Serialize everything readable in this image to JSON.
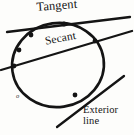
{
  "figure": {
    "background_color": "#fdfdfb",
    "ink_color": "#141414",
    "labels": {
      "tangent": "Tangent",
      "secant": "Secant",
      "exterior_line_1": "Exterior",
      "exterior_line_2": "line",
      "center_point": "o"
    }
  },
  "chart_data": {
    "type": "diagram",
    "xlabel": "",
    "ylabel": "",
    "xlim": [
      0,
      134
    ],
    "ylim": [
      0,
      135
    ],
    "grid": false,
    "legend": "none",
    "shapes": [
      {
        "name": "circle",
        "kind": "ellipse",
        "cx": 58,
        "cy": 65,
        "rx": 46,
        "ry": 42,
        "rotation_deg": -8,
        "stroke": "#141414",
        "stroke_width": 2.6,
        "fill": "none"
      },
      {
        "name": "tangent-line",
        "kind": "line",
        "x1": 7,
        "y1": 32,
        "x2": 130,
        "y2": 17,
        "stroke": "#141414",
        "stroke_width": 2.3,
        "touches_circle_at": [
          64,
          24
        ],
        "intersections": 1
      },
      {
        "name": "secant-line",
        "kind": "line",
        "x1": 1,
        "y1": 70,
        "x2": 132,
        "y2": 31,
        "stroke": "#141414",
        "stroke_width": 2.3,
        "intersections": 2,
        "crosses_circle_at": [
          [
            14,
            66
          ],
          [
            95,
            41
          ]
        ]
      },
      {
        "name": "exterior-line",
        "kind": "line",
        "x1": 57,
        "y1": 127,
        "x2": 124,
        "y2": 76,
        "stroke": "#141414",
        "stroke_width": 2.3,
        "intersections": 0
      }
    ],
    "points": [
      {
        "name": "tangent-point",
        "x": 64,
        "y": 24
      },
      {
        "name": "secant-point-left",
        "x": 14,
        "y": 66
      },
      {
        "name": "secant-point-right",
        "x": 95,
        "y": 41
      },
      {
        "name": "arc-point-upper-left",
        "x": 31,
        "y": 35
      },
      {
        "name": "arc-point-left",
        "x": 19,
        "y": 50
      },
      {
        "name": "arc-point-lower-right",
        "x": 75,
        "y": 95
      }
    ],
    "annotations": [
      {
        "text": "Tangent",
        "x": 36,
        "y": 1,
        "rotation_deg": -4.5
      },
      {
        "text": "Secant",
        "x": 44,
        "y": 36,
        "rotation_deg": -11
      },
      {
        "text": "Exterior",
        "x": 83,
        "y": 105,
        "rotation_deg": 0
      },
      {
        "text": "line",
        "x": 83,
        "y": 116,
        "rotation_deg": 0
      },
      {
        "text": "o",
        "x": 16,
        "y": 93,
        "rotation_deg": 0
      }
    ]
  }
}
